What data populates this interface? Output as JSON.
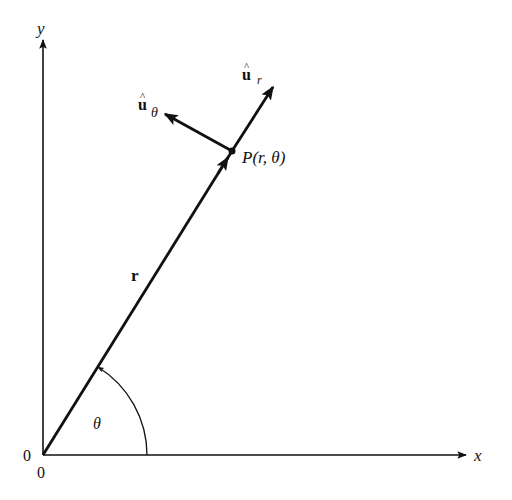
{
  "figure": {
    "colors": {
      "ink": "#111111",
      "background": "#ffffff"
    },
    "geometry": {
      "origin": [
        43,
        455
      ],
      "x_axis_end": [
        466,
        455
      ],
      "y_axis_end": [
        43,
        40
      ],
      "point_P": [
        232,
        151
      ],
      "u_r_tip": [
        273,
        87
      ],
      "u_theta_tip": [
        165,
        114
      ],
      "arc_radius": 104
    },
    "labels": {
      "y_axis": "y",
      "x_axis": "x",
      "origin_left": "0",
      "origin_below": "0",
      "radius_vector": "r",
      "angle": "θ",
      "point": "P(r, θ)",
      "u_r_base": "u",
      "u_r_hat": "^",
      "u_r_sub": "r",
      "u_theta_base": "u",
      "u_theta_hat": "^",
      "u_theta_sub": "θ"
    }
  }
}
